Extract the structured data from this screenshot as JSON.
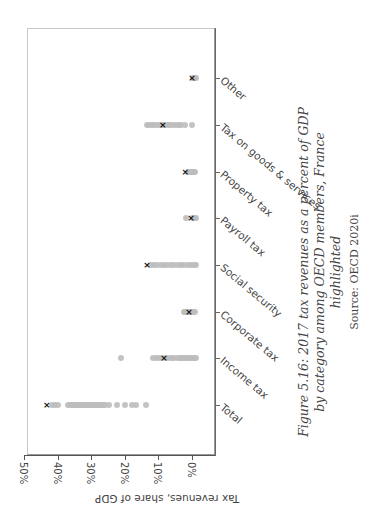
{
  "chart_data": {
    "type": "scatter",
    "title": "Figure 5.16: 2017 tax revenues as a percent of GDP by category among OECD members, France highlighted",
    "source": "Source: OECD 2020i",
    "ylabel": "Tax revenues, share of GDP",
    "xlabel": "",
    "orientation": "rotated page (figure rotated 90°)",
    "ylim": [
      0,
      50
    ],
    "yticks": [
      "50%",
      "40%",
      "30%",
      "20%",
      "10%",
      "0%"
    ],
    "categories": [
      "Total",
      "Income tax",
      "Corporate tax",
      "Social security",
      "Payroll tax",
      "Property tax",
      "Tax on goods & services",
      "Other"
    ],
    "highlight": {
      "name": "France",
      "marker": "x"
    },
    "series": [
      {
        "name": "OECD members",
        "marker": "circle",
        "color": "#bdbdbd",
        "values": {
          "Total": [
            43,
            42,
            41,
            38,
            37.5,
            37,
            36.5,
            36,
            35.5,
            35,
            34.5,
            34,
            33.5,
            33,
            32.5,
            32,
            31.5,
            31,
            30.5,
            30,
            29.5,
            29,
            28.5,
            28,
            27.5,
            27,
            26,
            23.5,
            21,
            19,
            18,
            15
          ],
          "Income tax": [
            22.3,
            12.8,
            12,
            11,
            10,
            9,
            8,
            7,
            6.5,
            5.5,
            5,
            4.5,
            4,
            3.5,
            3,
            2.5,
            2,
            1.5,
            1,
            0.5,
            0
          ],
          "Corporate tax": [
            3.6,
            3.2,
            2.8,
            2.4,
            2,
            1.6,
            1.2,
            0.8,
            0.4
          ],
          "Social security": [
            13.5,
            12.5,
            11.5,
            10.5,
            9.5,
            8.5,
            7.5,
            6.5,
            5.5,
            4.5,
            3.5,
            2.5,
            1.5,
            0.5,
            0
          ],
          "Payroll tax": [
            3,
            1,
            0.8,
            0.5,
            0.3,
            0.1
          ],
          "Property tax": [
            2.5,
            2,
            1.6,
            1.2,
            0.9,
            0.6,
            0.3
          ],
          "Tax on goods & services": [
            14.6,
            14,
            13.2,
            12.4,
            11.6,
            10.8,
            10,
            9.2,
            8.4,
            7.6,
            6.8,
            6,
            5.2,
            4.4,
            3.2,
            1.2
          ],
          "Other": [
            1,
            0.7,
            0.4,
            0.2,
            0
          ]
        }
      },
      {
        "name": "France",
        "marker": "x",
        "color": "#111111",
        "values": {
          "Total": 44.4,
          "Income tax": 9.5,
          "Corporate tax": 2.1,
          "Social security": 14.6,
          "Payroll tax": 1.5,
          "Property tax": 3.2,
          "Tax on goods & services": 9.9,
          "Other": 1.2
        }
      }
    ],
    "grid": false,
    "legend": "none"
  },
  "figure": {
    "caption": "Figure 5.16: 2017 tax revenues as a percent of GDP by category among OECD members, France highlighted",
    "source": "Source: OECD 2020i"
  }
}
